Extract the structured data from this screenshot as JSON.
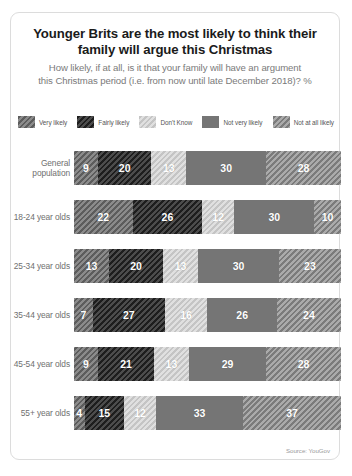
{
  "card": {
    "title": "Younger Brits are the most likely to think their family will argue this Christmas",
    "title_line1": "Younger Brits are the most likely to think their",
    "title_line2": "family will argue this Christmas",
    "subtitle_line1": "How likely, if at all, is it that your family will have an argument",
    "subtitle_line2": "this Christmas period (i.e. from now until late December 2018)? %",
    "source": "Source: YouGov"
  },
  "legend": {
    "items": [
      {
        "label": "Very likely",
        "color": "#6e6e6e"
      },
      {
        "label": "Fairly likely",
        "color": "#2a2a2a"
      },
      {
        "label": "Don't Know",
        "color": "#cfcfcf"
      },
      {
        "label": "Not very likely",
        "color": "#757575"
      },
      {
        "label": "Not at all likely",
        "color": "#8d8d8d"
      }
    ]
  },
  "chart_data": {
    "type": "bar",
    "title": "Younger Brits are the most likely to think their family will argue this Christmas",
    "subtitle": "How likely, if at all, is it that your family will have an argument this Christmas period (i.e. from now until late December 2018)? %",
    "xlabel": "",
    "ylabel": "",
    "xlim": [
      0,
      100
    ],
    "grid": false,
    "legend_position": "top",
    "orientation": "horizontal",
    "stacked": true,
    "categories": [
      "General population",
      "18-24 year olds",
      "25-34 year olds",
      "35-44 year olds",
      "45-54 year olds",
      "55+ year olds"
    ],
    "series": [
      {
        "name": "Very likely",
        "values": [
          9,
          22,
          13,
          7,
          9,
          4
        ]
      },
      {
        "name": "Fairly likely",
        "values": [
          20,
          26,
          20,
          27,
          21,
          15
        ]
      },
      {
        "name": "Don't Know",
        "values": [
          13,
          12,
          13,
          16,
          13,
          12
        ]
      },
      {
        "name": "Not very likely",
        "values": [
          30,
          30,
          30,
          26,
          29,
          33
        ]
      },
      {
        "name": "Not at all likely",
        "values": [
          28,
          10,
          23,
          24,
          28,
          37
        ]
      }
    ],
    "source": "Source: YouGov"
  },
  "rows": [
    {
      "label_line1": "General",
      "label_line2": "population",
      "segments": [
        {
          "value": "9",
          "pct": 9
        },
        {
          "value": "20",
          "pct": 20
        },
        {
          "value": "13",
          "pct": 13
        },
        {
          "value": "30",
          "pct": 30
        },
        {
          "value": "28",
          "pct": 28
        }
      ]
    },
    {
      "label_line1": "18-24 year olds",
      "label_line2": "",
      "segments": [
        {
          "value": "22",
          "pct": 22
        },
        {
          "value": "26",
          "pct": 26
        },
        {
          "value": "12",
          "pct": 12
        },
        {
          "value": "30",
          "pct": 30
        },
        {
          "value": "10",
          "pct": 10
        }
      ]
    },
    {
      "label_line1": "25-34 year olds",
      "label_line2": "",
      "segments": [
        {
          "value": "13",
          "pct": 13
        },
        {
          "value": "20",
          "pct": 20
        },
        {
          "value": "13",
          "pct": 13
        },
        {
          "value": "30",
          "pct": 30
        },
        {
          "value": "23",
          "pct": 23
        }
      ]
    },
    {
      "label_line1": "35-44 year olds",
      "label_line2": "",
      "segments": [
        {
          "value": "7",
          "pct": 7
        },
        {
          "value": "27",
          "pct": 27
        },
        {
          "value": "16",
          "pct": 16
        },
        {
          "value": "26",
          "pct": 26
        },
        {
          "value": "24",
          "pct": 24
        }
      ]
    },
    {
      "label_line1": "45-54 year olds",
      "label_line2": "",
      "segments": [
        {
          "value": "9",
          "pct": 9
        },
        {
          "value": "21",
          "pct": 21
        },
        {
          "value": "13",
          "pct": 13
        },
        {
          "value": "29",
          "pct": 29
        },
        {
          "value": "28",
          "pct": 28
        }
      ]
    },
    {
      "label_line1": "55+ year olds",
      "label_line2": "",
      "segments": [
        {
          "value": "4",
          "pct": 4
        },
        {
          "value": "15",
          "pct": 15
        },
        {
          "value": "12",
          "pct": 12
        },
        {
          "value": "33",
          "pct": 33
        },
        {
          "value": "37",
          "pct": 37
        }
      ]
    }
  ]
}
